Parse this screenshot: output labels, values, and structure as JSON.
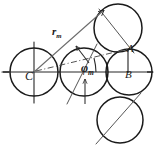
{
  "figure": {
    "kind": "geometric-construction-diagram",
    "background_color": "#ffffff",
    "ink_color": "#1a1a1a",
    "axis_color": "#262626",
    "construction_color": "#555555"
  },
  "labels": {
    "center_C": "C",
    "point_A": "A",
    "point_B": "B",
    "radius_vector": "r",
    "radius_vector_subscript": "m",
    "angle": "φ",
    "angle_subscript": "m"
  },
  "geometry": {
    "axis": {
      "type": "horizontal-axis",
      "y": 72,
      "x_start": 2,
      "x_end": 153
    },
    "vertical_axis_through_C": {
      "x": 34,
      "y_start": 42,
      "y_end": 103
    },
    "circles": [
      {
        "name": "circle-C",
        "cx": 34,
        "cy": 72,
        "r": 24
      },
      {
        "name": "circle-middle",
        "cx": 84,
        "cy": 72,
        "r": 24
      },
      {
        "name": "circle-B",
        "cx": 129,
        "cy": 72,
        "r": 23
      },
      {
        "name": "circle-top-right",
        "cx": 118,
        "cy": 28,
        "r": 24
      },
      {
        "name": "circle-bottom-right",
        "cx": 120,
        "cy": 120,
        "r": 23
      }
    ],
    "radius_vector_line": {
      "from_x": 34,
      "from_y": 72,
      "to_x": 106,
      "to_y": 8,
      "arrowhead": "at-far-end-up-right"
    },
    "chord_line": {
      "from_x": 34,
      "from_y": 72,
      "to_x": 129,
      "to_y": 48,
      "style": "dash-dot"
    },
    "angle_arc": {
      "center_x": 34,
      "center_y": 72,
      "radius": 62,
      "from_deg": 0,
      "to_deg": 15
    },
    "segment_AB": {
      "from_x": 128,
      "from_y": 49,
      "to_x": 128,
      "to_y": 72
    },
    "tangent_arrows": [
      {
        "name": "arrow-middle-top",
        "x1": 88,
        "y1": 62,
        "x2": 76,
        "y2": 46
      },
      {
        "name": "arrow-middle-bottom",
        "x1": 85,
        "y1": 106,
        "x2": 85,
        "y2": 80
      }
    ],
    "through_lines": [
      {
        "name": "line-through-top-right-circle",
        "x1": 98,
        "y1": 8,
        "x2": 133,
        "y2": 52
      },
      {
        "name": "line-through-bottom-right-circle",
        "x1": 96,
        "y1": 143,
        "x2": 140,
        "y2": 94
      },
      {
        "name": "line-through-middle-circle",
        "x1": 68,
        "y1": 103,
        "x2": 96,
        "y2": 45
      }
    ]
  }
}
